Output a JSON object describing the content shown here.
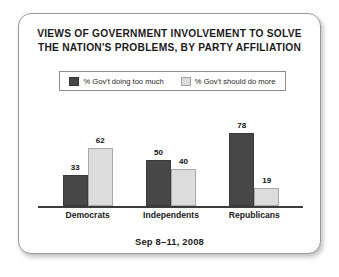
{
  "card": {
    "title_lines": [
      "VIEWS OF GOVERNMENT INVOLVEMENT TO SOLVE",
      "THE NATION'S PROBLEMS, BY PARTY AFFILIATION"
    ],
    "footer": "Sep 8–11, 2008"
  },
  "colors": {
    "series_dark": "#474747",
    "series_light": "#dcdcdc",
    "card_border": "#9a9a9a",
    "axis": "#3c3c3c",
    "text": "#1b1b1b",
    "background": "#ffffff"
  },
  "chart_data": {
    "type": "bar",
    "title": "VIEWS OF GOVERNMENT INVOLVEMENT TO SOLVE THE NATION'S PROBLEMS, BY PARTY AFFILIATION",
    "subtitle": "Sep 8–11, 2008",
    "categories": [
      "Democrats",
      "Independents",
      "Republicans"
    ],
    "series": [
      {
        "name": "% Gov't doing too much",
        "color": "#474747",
        "values": [
          33,
          50,
          78
        ]
      },
      {
        "name": "% Gov't should do more",
        "color": "#dcdcdc",
        "values": [
          62,
          40,
          19
        ]
      }
    ],
    "xlabel": "",
    "ylabel": "",
    "ylim": [
      0,
      100
    ],
    "grid": false,
    "legend_position": "top",
    "data_labels": true,
    "axis_visible": "x-only"
  }
}
